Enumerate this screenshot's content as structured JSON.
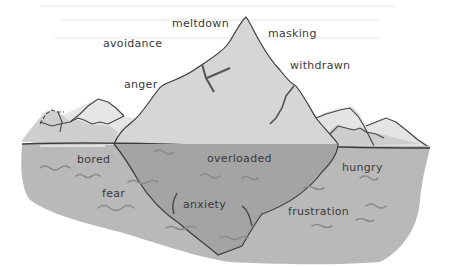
{
  "diagram": {
    "type": "iceberg",
    "colors": {
      "background": "#ffffff",
      "iceberg_above": "#d6d6d6",
      "distant_ice": "#e4e4e4",
      "water": "#b9b9b9",
      "iceberg_below": "#a4a4a4",
      "outline": "#3c3c3c",
      "wave": "#8e8e8e",
      "text": "#3a3a3a"
    },
    "above_water": {
      "labels": [
        {
          "id": "meltdown",
          "text": "meltdown"
        },
        {
          "id": "masking",
          "text": "masking"
        },
        {
          "id": "avoidance",
          "text": "avoidance"
        },
        {
          "id": "withdrawn",
          "text": "withdrawn"
        },
        {
          "id": "anger",
          "text": "anger"
        }
      ]
    },
    "below_water": {
      "labels": [
        {
          "id": "bored",
          "text": "bored"
        },
        {
          "id": "overloaded",
          "text": "overloaded"
        },
        {
          "id": "hungry",
          "text": "hungry"
        },
        {
          "id": "fear",
          "text": "fear"
        },
        {
          "id": "anxiety",
          "text": "anxiety"
        },
        {
          "id": "frustration",
          "text": "frustration"
        }
      ]
    }
  }
}
